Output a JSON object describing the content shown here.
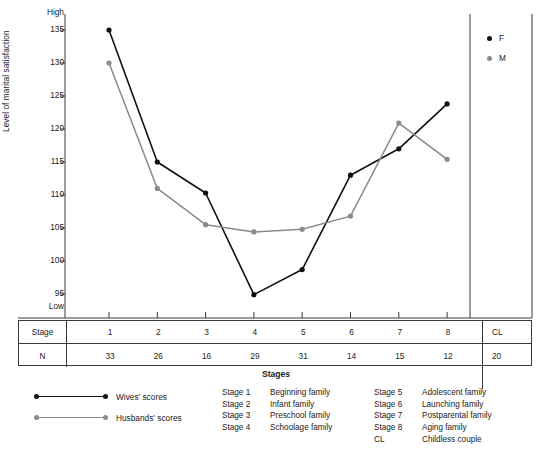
{
  "chart_data": {
    "type": "line",
    "title": "",
    "xlabel": "Stages",
    "ylabel": "Level of marital satisfaction",
    "x": [
      1,
      2,
      3,
      4,
      5,
      6,
      7,
      8
    ],
    "categories": [
      "1",
      "2",
      "3",
      "4",
      "5",
      "6",
      "7",
      "8"
    ],
    "ylim": [
      93,
      137
    ],
    "yticks": [
      95,
      100,
      105,
      110,
      115,
      120,
      125,
      130,
      135
    ],
    "ytick_labels": [
      "95",
      "100",
      "105",
      "110",
      "115",
      "120",
      "125",
      "130",
      "135"
    ],
    "y_axis_high_label": "High",
    "y_axis_low_label": "Low",
    "grid": false,
    "legend_position": "inside-right",
    "series": [
      {
        "name": "F",
        "label": "Wives' scores",
        "color": "#111111",
        "values": [
          135.0,
          115.0,
          110.3,
          94.9,
          98.7,
          113.0,
          117.0,
          123.8
        ]
      },
      {
        "name": "M",
        "label": "Husbands' scores",
        "color": "#8a8a8a",
        "values": [
          130.0,
          111.0,
          105.5,
          104.4,
          104.8,
          106.8,
          120.9,
          115.4
        ]
      }
    ]
  },
  "in_plot_legend": [
    {
      "symbol": "dot-black",
      "label": "F"
    },
    {
      "symbol": "dot-grey",
      "label": "M"
    }
  ],
  "table": {
    "row_headers": [
      "Stage",
      "N"
    ],
    "stage_values": [
      "1",
      "2",
      "3",
      "4",
      "5",
      "6",
      "7",
      "8"
    ],
    "stage_extra": "CL",
    "n_values": [
      "33",
      "26",
      "16",
      "29",
      "31",
      "14",
      "15",
      "12"
    ],
    "n_extra": "20"
  },
  "axis_bottom_label": "Stages",
  "series_legend": [
    {
      "key": "wives",
      "label": "Wives' scores",
      "color": "#111111"
    },
    {
      "key": "husbands",
      "label": "Husbands' scores",
      "color": "#8a8a8a"
    }
  ],
  "stage_definitions": {
    "column_left": [
      {
        "key": "Stage 1",
        "value": "Beginning family"
      },
      {
        "key": "Stage 2",
        "value": "Infant family"
      },
      {
        "key": "Stage 3",
        "value": "Preschool family"
      },
      {
        "key": "Stage 4",
        "value": "Schoolage family"
      }
    ],
    "column_right": [
      {
        "key": "Stage 5",
        "value": "Adolescent family"
      },
      {
        "key": "Stage 6",
        "value": "Launching family"
      },
      {
        "key": "Stage 7",
        "value": "Postparental family"
      },
      {
        "key": "Stage 8",
        "value": "Aging family"
      },
      {
        "key": "CL",
        "value": "Childless couple"
      }
    ]
  },
  "colors": {
    "series_f": "#111111",
    "series_m": "#8a8a8a",
    "axis": "#3a3a3a",
    "background": "#ffffff"
  }
}
